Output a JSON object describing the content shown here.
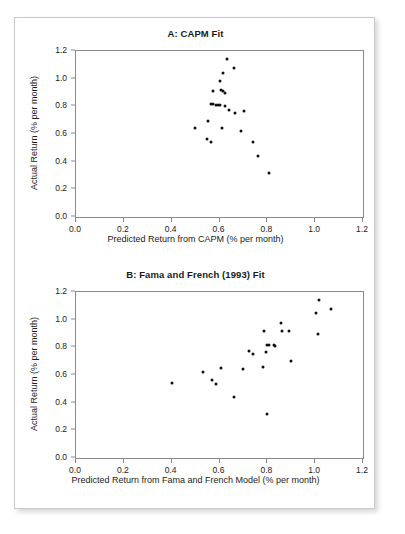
{
  "figure": {
    "panels": [
      {
        "id": "panel-a",
        "title": "A: CAPM Fit",
        "xlabel": "Predicted Return from CAPM (% per month)",
        "ylabel": "Actual Return (% per month)"
      },
      {
        "id": "panel-b",
        "title": "B: Fama and French (1993) Fit",
        "xlabel": "Predicted Return from Fama and French Model (% per month)",
        "ylabel": "Actual Return (% per month)"
      }
    ],
    "axis": {
      "xticks": [
        "0.0",
        "0.2",
        "0.4",
        "0.6",
        "0.8",
        "1.0",
        "1.2"
      ],
      "yticks": [
        "0.0",
        "0.2",
        "0.4",
        "0.6",
        "0.8",
        "1.0",
        "1.2"
      ]
    },
    "colors": {
      "marker": "#111111",
      "axis": "#8a8a8a",
      "frame_border": "#c9c9c9",
      "text": "#1a1a1a",
      "background": "#ffffff"
    }
  },
  "chart_data": [
    {
      "type": "scatter",
      "title": "A: CAPM Fit",
      "xlabel": "Predicted Return from CAPM (% per month)",
      "ylabel": "Actual Return (% per month)",
      "xlim": [
        0.0,
        1.2
      ],
      "ylim": [
        0.0,
        1.2
      ],
      "xticks": [
        0.0,
        0.2,
        0.4,
        0.6,
        0.8,
        1.0,
        1.2
      ],
      "yticks": [
        0.0,
        0.2,
        0.4,
        0.6,
        0.8,
        1.0,
        1.2
      ],
      "grid": false,
      "legend": null,
      "series": [
        {
          "name": "Portfolios",
          "points": [
            [
              0.633,
              1.14
            ],
            [
              0.659,
              1.08
            ],
            [
              0.613,
              1.04
            ],
            [
              0.601,
              0.98
            ],
            [
              0.573,
              0.91
            ],
            [
              0.607,
              0.92
            ],
            [
              0.615,
              0.91
            ],
            [
              0.622,
              0.9
            ],
            [
              0.566,
              0.82
            ],
            [
              0.571,
              0.82
            ],
            [
              0.585,
              0.81
            ],
            [
              0.594,
              0.81
            ],
            [
              0.604,
              0.81
            ],
            [
              0.623,
              0.8
            ],
            [
              0.641,
              0.77
            ],
            [
              0.663,
              0.75
            ],
            [
              0.703,
              0.765
            ],
            [
              0.553,
              0.695
            ],
            [
              0.498,
              0.645
            ],
            [
              0.612,
              0.645
            ],
            [
              0.69,
              0.625
            ],
            [
              0.546,
              0.565
            ],
            [
              0.566,
              0.54
            ],
            [
              0.739,
              0.54
            ],
            [
              0.763,
              0.44
            ],
            [
              0.808,
              0.32
            ]
          ]
        }
      ]
    },
    {
      "type": "scatter",
      "title": "B: Fama and French (1993) Fit",
      "xlabel": "Predicted Return from Fama and French Model (% per month)",
      "ylabel": "Actual Return (% per month)",
      "xlim": [
        0.0,
        1.2
      ],
      "ylim": [
        0.0,
        1.2
      ],
      "xticks": [
        0.0,
        0.2,
        0.4,
        0.6,
        0.8,
        1.0,
        1.2
      ],
      "yticks": [
        0.0,
        0.2,
        0.4,
        0.6,
        0.8,
        1.0,
        1.2
      ],
      "grid": false,
      "legend": null,
      "series": [
        {
          "name": "Portfolios",
          "points": [
            [
              1.015,
              1.14
            ],
            [
              1.068,
              1.08
            ],
            [
              1.005,
              1.045
            ],
            [
              0.856,
              0.975
            ],
            [
              0.786,
              0.915
            ],
            [
              0.862,
              0.915
            ],
            [
              0.89,
              0.915
            ],
            [
              1.012,
              0.9
            ],
            [
              0.8,
              0.82
            ],
            [
              0.808,
              0.82
            ],
            [
              0.828,
              0.82
            ],
            [
              0.83,
              0.81
            ],
            [
              0.722,
              0.77
            ],
            [
              0.795,
              0.765
            ],
            [
              0.742,
              0.755
            ],
            [
              0.9,
              0.7
            ],
            [
              0.605,
              0.65
            ],
            [
              0.782,
              0.655
            ],
            [
              0.7,
              0.645
            ],
            [
              0.53,
              0.623
            ],
            [
              0.567,
              0.565
            ],
            [
              0.4,
              0.54
            ],
            [
              0.585,
              0.535
            ],
            [
              0.66,
              0.44
            ],
            [
              0.8,
              0.32
            ]
          ]
        }
      ]
    }
  ]
}
